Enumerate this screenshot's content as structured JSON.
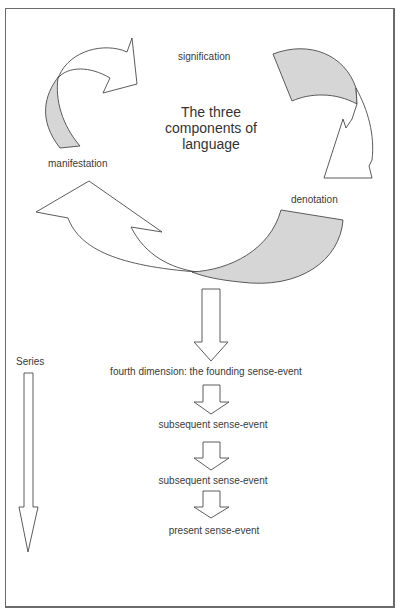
{
  "diagram": {
    "title_lines": [
      "The three",
      "components of",
      "language"
    ],
    "components": {
      "signification": "signification",
      "manifestation": "manifestation",
      "denotation": "denotation"
    },
    "series_label": "Series",
    "sequence": [
      "fourth dimension: the founding sense-event",
      "subsequent sense-event",
      "subsequent sense-event",
      "present sense-event"
    ],
    "colors": {
      "border": "#6a6a6a",
      "stroke": "#4a4a4a",
      "shaded_band": "#d6d6d6",
      "text": "#3a3a3a"
    }
  }
}
